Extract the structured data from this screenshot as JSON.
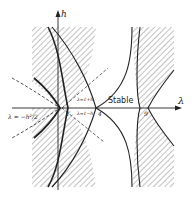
{
  "diagram": {
    "axes": {
      "x_label": "λ",
      "y_label": "h"
    },
    "region_labels": {
      "stable": "Stable"
    },
    "line_labels": {
      "upper": "λ=1+h",
      "lower": "λ=1−h",
      "parabola": "λ = −h²/2"
    },
    "tick_labels": [
      "1",
      "4",
      "9"
    ],
    "colors": {
      "ink": "#222222",
      "hatch": "#555555",
      "background": "#ffffff"
    }
  }
}
